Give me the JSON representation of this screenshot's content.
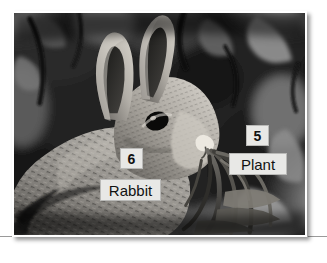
{
  "figure": {
    "media_type": "photograph",
    "color_mode": "grayscale",
    "frame_color": "#ffffff",
    "rule_color": "#9a9a9a",
    "annotations": [
      {
        "id": "num-6",
        "text": "6",
        "kind": "number",
        "target": "rabbit"
      },
      {
        "id": "rabbit",
        "text": "Rabbit",
        "kind": "name",
        "target": "rabbit"
      },
      {
        "id": "num-5",
        "text": "5",
        "kind": "number",
        "target": "plant"
      },
      {
        "id": "plant",
        "text": "Plant",
        "kind": "name",
        "target": "plant"
      }
    ],
    "label_style": {
      "background": "#e8e8e6",
      "border": "#b9b9b7",
      "text_color": "#111111"
    }
  }
}
